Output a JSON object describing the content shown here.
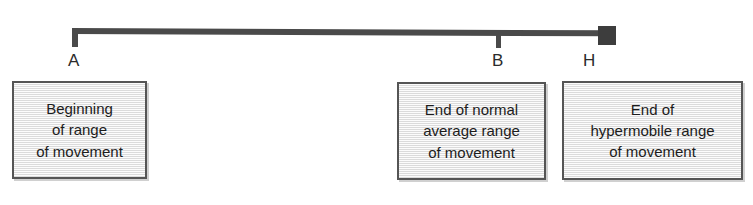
{
  "diagram": {
    "colors": {
      "bar": "#4a4a4a",
      "end_block": "#3d3d3d",
      "box_border": "#555555",
      "box_fill": "#ececec",
      "text": "#1c1c1c",
      "background": "#ffffff"
    },
    "markers": [
      {
        "id": "A",
        "label": "A",
        "type": "start-tick",
        "x": 75,
        "caption_ref": "box_a"
      },
      {
        "id": "B",
        "label": "B",
        "type": "mid-tick",
        "x": 498,
        "caption_ref": "box_b"
      },
      {
        "id": "H",
        "label": "H",
        "type": "end-block",
        "x": 607,
        "caption_ref": "box_h"
      }
    ],
    "captions": {
      "box_a": "Beginning\nof range\nof movement",
      "box_b": "End of normal\naverage range\nof movement",
      "box_h": "End of\nhypermobile range\nof movement"
    }
  },
  "chart_data": {
    "type": "line",
    "xlabel": "",
    "ylabel": "",
    "categories": [
      "A",
      "B",
      "H"
    ],
    "values": [
      0,
      78,
      99
    ],
    "annotations": [
      "Beginning of range of movement",
      "End of normal average range of movement",
      "End of hypermobile range of movement"
    ],
    "grid": false,
    "legend": "none"
  }
}
